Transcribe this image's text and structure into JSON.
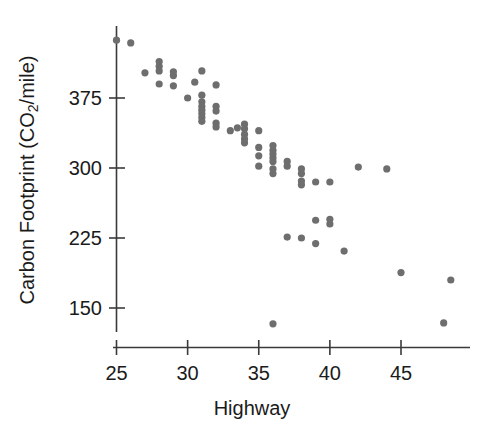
{
  "chart_data": {
    "type": "scatter",
    "title": "",
    "xlabel": "Highway",
    "ylabel": "Carbon Footprint (CO2/mile)",
    "ylabel_parts": {
      "before": "Carbon Footprint (CO",
      "subscript": "2",
      "after": "/mile)"
    },
    "xlim": [
      24.0,
      49.3
    ],
    "ylim": [
      120,
      447
    ],
    "xticks": [
      25,
      30,
      35,
      40,
      45
    ],
    "xticklabels": [
      "25",
      "30",
      "35",
      "40",
      "45"
    ],
    "yticks": [
      150,
      225,
      300,
      375
    ],
    "yticklabels": [
      "150",
      "225",
      "300",
      "375"
    ],
    "grid": false,
    "legend": null,
    "marker": "circle",
    "marker_color": "#6e6e6e",
    "marker_size": 6,
    "n_points": 64,
    "points": [
      {
        "x": 25.0,
        "y": 437
      },
      {
        "x": 26.0,
        "y": 434
      },
      {
        "x": 28.0,
        "y": 414
      },
      {
        "x": 28.0,
        "y": 409
      },
      {
        "x": 28.0,
        "y": 404
      },
      {
        "x": 27.0,
        "y": 402
      },
      {
        "x": 29.0,
        "y": 403
      },
      {
        "x": 29.0,
        "y": 399
      },
      {
        "x": 31.0,
        "y": 404
      },
      {
        "x": 28.0,
        "y": 390
      },
      {
        "x": 29.0,
        "y": 388
      },
      {
        "x": 32.0,
        "y": 389
      },
      {
        "x": 30.0,
        "y": 375
      },
      {
        "x": 31.0,
        "y": 378
      },
      {
        "x": 31.0,
        "y": 371
      },
      {
        "x": 31.0,
        "y": 366
      },
      {
        "x": 31.0,
        "y": 362
      },
      {
        "x": 31.0,
        "y": 358
      },
      {
        "x": 31.0,
        "y": 354
      },
      {
        "x": 31.0,
        "y": 350
      },
      {
        "x": 32.0,
        "y": 366
      },
      {
        "x": 32.0,
        "y": 361
      },
      {
        "x": 32.0,
        "y": 348
      },
      {
        "x": 32.0,
        "y": 344
      },
      {
        "x": 33.0,
        "y": 340
      },
      {
        "x": 34.0,
        "y": 347
      },
      {
        "x": 34.0,
        "y": 342
      },
      {
        "x": 34.0,
        "y": 336
      },
      {
        "x": 34.0,
        "y": 331
      },
      {
        "x": 34.0,
        "y": 327
      },
      {
        "x": 35.0,
        "y": 322
      },
      {
        "x": 35.0,
        "y": 313
      },
      {
        "x": 35.0,
        "y": 302
      },
      {
        "x": 36.0,
        "y": 324
      },
      {
        "x": 36.0,
        "y": 319
      },
      {
        "x": 36.0,
        "y": 315
      },
      {
        "x": 36.0,
        "y": 311
      },
      {
        "x": 36.0,
        "y": 307
      },
      {
        "x": 36.0,
        "y": 299
      },
      {
        "x": 36.0,
        "y": 294
      },
      {
        "x": 37.0,
        "y": 307
      },
      {
        "x": 37.0,
        "y": 302
      },
      {
        "x": 38.0,
        "y": 299
      },
      {
        "x": 38.0,
        "y": 294
      },
      {
        "x": 38.0,
        "y": 286
      },
      {
        "x": 38.0,
        "y": 282
      },
      {
        "x": 39.0,
        "y": 285
      },
      {
        "x": 40.0,
        "y": 285
      },
      {
        "x": 37.0,
        "y": 226
      },
      {
        "x": 38.0,
        "y": 225
      },
      {
        "x": 39.0,
        "y": 244
      },
      {
        "x": 39.0,
        "y": 219
      },
      {
        "x": 40.0,
        "y": 245
      },
      {
        "x": 40.0,
        "y": 240
      },
      {
        "x": 41.0,
        "y": 211
      },
      {
        "x": 42.0,
        "y": 301
      },
      {
        "x": 44.0,
        "y": 299
      },
      {
        "x": 45.0,
        "y": 188
      },
      {
        "x": 48.5,
        "y": 180
      },
      {
        "x": 36.0,
        "y": 133
      },
      {
        "x": 48.0,
        "y": 134
      },
      {
        "x": 35.0,
        "y": 340
      },
      {
        "x": 33.5,
        "y": 343
      },
      {
        "x": 30.5,
        "y": 392
      }
    ]
  },
  "axis": {
    "x_tick_count": 5,
    "y_tick_count": 4
  }
}
